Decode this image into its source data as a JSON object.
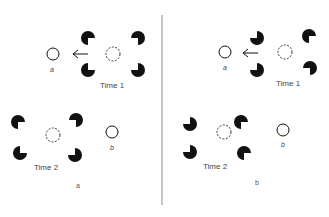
{
  "figure": {
    "divider_color": "#8a8a8a",
    "ink_color": "#111111",
    "panels": [
      {
        "id": "a",
        "panel_label": "a",
        "time1": {
          "label": "Time 1",
          "target_label": "a",
          "arrow": "left"
        },
        "time2": {
          "label": "Time 2",
          "target_label": "b"
        }
      },
      {
        "id": "b",
        "panel_label": "b",
        "time1": {
          "label": "Time 1",
          "target_label": "a",
          "arrow": "left"
        },
        "time2": {
          "label": "Time 2",
          "target_label": "b"
        }
      }
    ]
  }
}
